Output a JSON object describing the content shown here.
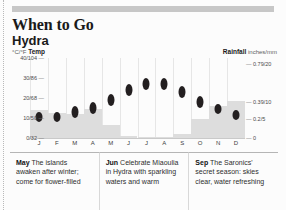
{
  "header": {
    "title": "When to Go",
    "subtitle": "Hydra"
  },
  "legend": {
    "left_unit": "°C/°F",
    "left_label": "Temp",
    "right_label": "Rainfall",
    "right_unit": "inches/mm"
  },
  "axis": {
    "left_ticks": [
      "40/104",
      "30/86",
      "20/68",
      "10/50",
      "0/32"
    ],
    "right_ticks": [
      "0.79/20",
      "0.39/10",
      "0.2/5",
      "0"
    ]
  },
  "blurbs": [
    {
      "month": "May",
      "text": " The islands awaken after winter; come for flower-filled"
    },
    {
      "month": "Jun",
      "text": " Celebrate Miaoulia in Hydra with sparkling waters and warm"
    },
    {
      "month": "Sep",
      "text": " The Saronics' secret season: skies clear, water refreshing"
    }
  ],
  "chart_data": {
    "type": "bar",
    "categories": [
      "J",
      "F",
      "M",
      "A",
      "M",
      "J",
      "J",
      "A",
      "S",
      "O",
      "N",
      "D"
    ],
    "xlabel": "",
    "ylabel": "Temp °C/°F",
    "ylim": [
      0,
      40
    ],
    "y2label": "Rainfall inches/mm",
    "y2lim": [
      0,
      0.79
    ],
    "grid": false,
    "legend_position": "top",
    "series": [
      {
        "name": "Temp",
        "type": "range-marker",
        "unit": "°C",
        "values": [
          11,
          11,
          13,
          15,
          19,
          24,
          27,
          27,
          23,
          18,
          15,
          12
        ],
        "low": [
          8,
          8,
          10,
          12,
          16,
          21,
          24,
          24,
          20,
          15,
          12,
          9
        ],
        "high": [
          13,
          13,
          16,
          18,
          22,
          27,
          30,
          30,
          26,
          21,
          17,
          14
        ]
      },
      {
        "name": "Rainfall",
        "type": "bar",
        "unit": "inches",
        "values": [
          0.3,
          0.27,
          0.26,
          0.31,
          0.14,
          0.02,
          0.01,
          0.01,
          0.04,
          0.2,
          0.34,
          0.4
        ]
      }
    ]
  }
}
